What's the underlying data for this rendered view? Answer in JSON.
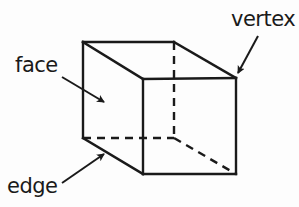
{
  "diagram": {
    "type": "cube",
    "labels": {
      "face": "face",
      "vertex": "vertex",
      "edge": "edge"
    },
    "colors": {
      "stroke": "#1a1a1a",
      "background": "#fdfdfd"
    }
  }
}
